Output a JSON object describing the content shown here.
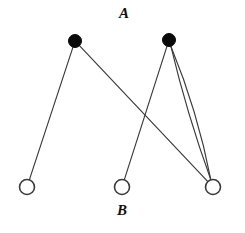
{
  "figure": {
    "width": 245,
    "height": 233,
    "background_color": "#ffffff",
    "edge_color": "#3a3a3a",
    "filled_node_color": "#0a0a0a",
    "open_node_fill": "#ffffff",
    "open_node_stroke": "#3a3a3a",
    "label_color": "#111111"
  },
  "labels": [
    {
      "id": "label-a",
      "text": "A",
      "x": 124,
      "y": 15,
      "style": "italic"
    },
    {
      "id": "label-b",
      "text": "B",
      "x": 122,
      "y": 212,
      "style": "italic"
    }
  ],
  "nodes": [
    {
      "id": "a1",
      "set": "A",
      "type": "filled",
      "x": 75,
      "y": 41,
      "r": 6.5
    },
    {
      "id": "a2",
      "set": "A",
      "type": "filled",
      "x": 169,
      "y": 40,
      "r": 6.5
    },
    {
      "id": "b1",
      "set": "B",
      "type": "open",
      "x": 27,
      "y": 187,
      "r": 7.5
    },
    {
      "id": "b2",
      "set": "B",
      "type": "open",
      "x": 122,
      "y": 187,
      "r": 7.5
    },
    {
      "id": "b3",
      "set": "B",
      "type": "open",
      "x": 213,
      "y": 187,
      "r": 7.5
    }
  ],
  "edges": [
    {
      "id": "e1",
      "from": "a1",
      "to": "b1",
      "bow": 0
    },
    {
      "id": "e2",
      "from": "a1",
      "to": "b3",
      "bow": 0
    },
    {
      "id": "e3",
      "from": "a2",
      "to": "b2",
      "bow": 0
    },
    {
      "id": "e4",
      "from": "a2",
      "to": "b3",
      "bow": -7
    },
    {
      "id": "e5",
      "from": "a2",
      "to": "b3",
      "bow": 4
    }
  ],
  "counts": {
    "filled_nodes": 2,
    "open_nodes": 3,
    "edges": 5
  }
}
